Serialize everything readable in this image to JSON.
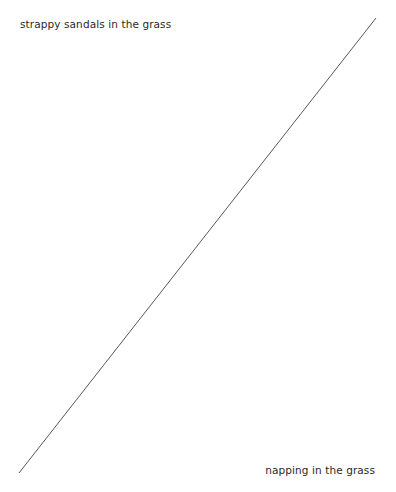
{
  "diagram": {
    "top_left_label": "strappy sandals in the grass",
    "bottom_right_label": "napping in the grass",
    "line": {
      "x1": 376,
      "y1": 18,
      "x2": 19,
      "y2": 473,
      "color": "#444444"
    }
  }
}
